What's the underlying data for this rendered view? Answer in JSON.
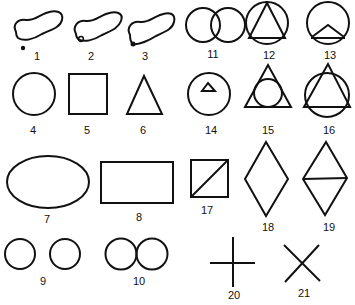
{
  "figure": {
    "stroke_color": "#111111",
    "background": "#ffffff",
    "shapes": [
      {
        "id": "1",
        "label": "1",
        "kind": "blob-with-dot-outside"
      },
      {
        "id": "2",
        "label": "2",
        "kind": "blob-with-circle-inside"
      },
      {
        "id": "3",
        "label": "3",
        "kind": "blob-with-dot-on-edge"
      },
      {
        "id": "4",
        "label": "4",
        "kind": "circle"
      },
      {
        "id": "5",
        "label": "5",
        "kind": "square"
      },
      {
        "id": "6",
        "label": "6",
        "kind": "triangle"
      },
      {
        "id": "7",
        "label": "7",
        "kind": "ellipse"
      },
      {
        "id": "8",
        "label": "8",
        "kind": "rectangle"
      },
      {
        "id": "9",
        "label": "9",
        "kind": "two-separate-circles"
      },
      {
        "id": "10",
        "label": "10",
        "kind": "two-touching-circles"
      },
      {
        "id": "11",
        "label": "11",
        "kind": "two-overlapping-circles"
      },
      {
        "id": "12",
        "label": "12",
        "kind": "triangle-inscribed-in-circle"
      },
      {
        "id": "13",
        "label": "13",
        "kind": "circle-with-chevron-chord"
      },
      {
        "id": "14",
        "label": "14",
        "kind": "small-triangle-inside-circle"
      },
      {
        "id": "15",
        "label": "15",
        "kind": "circle-inscribed-in-triangle"
      },
      {
        "id": "16",
        "label": "16",
        "kind": "triangle-overlapping-circle"
      },
      {
        "id": "17",
        "label": "17",
        "kind": "square-with-diagonal"
      },
      {
        "id": "18",
        "label": "18",
        "kind": "diamond"
      },
      {
        "id": "19",
        "label": "19",
        "kind": "diamond-with-horizontal-line"
      },
      {
        "id": "20",
        "label": "20",
        "kind": "plus-cross"
      },
      {
        "id": "21",
        "label": "21",
        "kind": "x-cross"
      }
    ]
  }
}
